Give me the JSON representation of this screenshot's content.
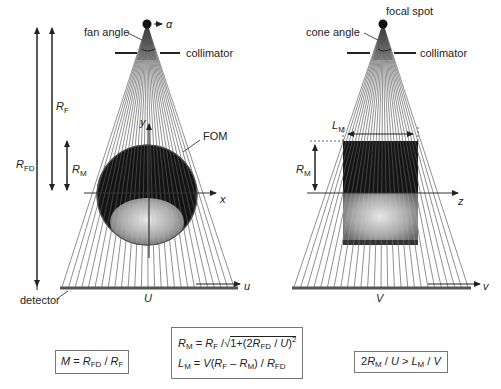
{
  "left_panel": {
    "title": "fan-beam geometry",
    "source_label": "α",
    "fan_angle_label": "fan angle",
    "collimator_label": "collimator",
    "fom_label": "FOM",
    "rf_label": "R",
    "rf_sub": "F",
    "rfd_label": "R",
    "rfd_sub": "FD",
    "rm_label": "R",
    "rm_sub": "M",
    "y_axis": "y",
    "x_axis": "x",
    "u_axis": "u",
    "detector_label": "detector",
    "detector_width": "U"
  },
  "right_panel": {
    "title": "cone-beam geometry",
    "focal_spot_label": "focal spot",
    "cone_angle_label": "cone angle",
    "collimator_label": "collimator",
    "lm_label": "L",
    "lm_sub": "M",
    "rm_label": "R",
    "rm_sub": "M",
    "z_axis": "z",
    "v_axis": "v",
    "detector_width": "V"
  },
  "formulas": {
    "magnification": {
      "lhs": "M",
      "eq": " = ",
      "a": "R",
      "a_sub": "FD",
      "div": " / ",
      "b": "R",
      "b_sub": "F"
    },
    "rm_formula": {
      "lhs": "R",
      "lhs_sub": "M",
      "eq": " = ",
      "a": "R",
      "a_sub": "F",
      "div": " /",
      "sqrt_body_pre": "1+(2",
      "r": "R",
      "r_sub": "FD",
      "post": " / ",
      "u": "U",
      "close": ")",
      "exp": "2"
    },
    "lm_formula": {
      "lhs": "L",
      "lhs_sub": "M",
      "eq": " = ",
      "v": "V",
      "open": "(",
      "a": "R",
      "a_sub": "F",
      "minus": " – ",
      "b": "R",
      "b_sub": "M",
      "close": ") / ",
      "c": "R",
      "c_sub": "FD"
    },
    "condition": {
      "pre": "2",
      "a": "R",
      "a_sub": "M",
      "div1": " / ",
      "u": "U",
      "gt": " > ",
      "l": "L",
      "l_sub": "M",
      "div2": " / ",
      "v": "V"
    }
  },
  "colors": {
    "ink": "#222222",
    "ray": "#444444",
    "detector": "#555555",
    "fom_dark": "#111111",
    "specimen": "#bdbdbd",
    "box_border": "#777777"
  }
}
